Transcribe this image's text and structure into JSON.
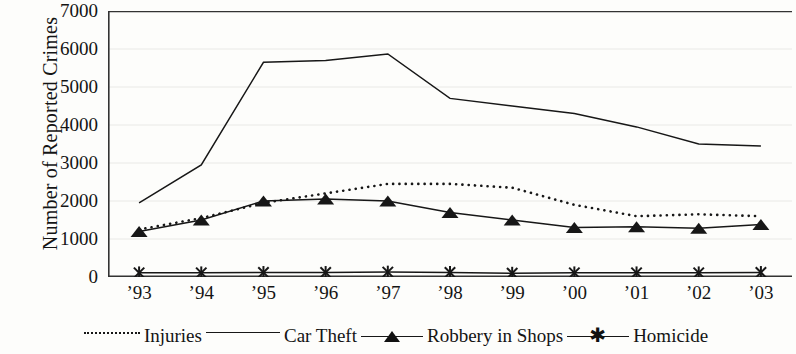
{
  "axes": {
    "ylabel": "Number of Reported Crimes",
    "yticks": [
      "0",
      "1000",
      "2000",
      "3000",
      "4000",
      "5000",
      "6000",
      "7000"
    ],
    "xticks": [
      "’93",
      "’94",
      "’95",
      "’96",
      "’97",
      "’98",
      "’99",
      "’00",
      "’01",
      "’02",
      "’03"
    ]
  },
  "legend": {
    "items": [
      {
        "label": "Injuries",
        "style": "dotted"
      },
      {
        "label": "Car Theft",
        "style": "solid"
      },
      {
        "label": "Robbery in Shops",
        "style": "solid-triangle"
      },
      {
        "label": "Homicide",
        "style": "solid-star"
      }
    ]
  },
  "colors": {
    "ink": "#171717",
    "grid": "#e9e9e6",
    "background": "#fdfdfb"
  },
  "chart_data": {
    "type": "line",
    "title": "",
    "xlabel": "",
    "ylabel": "Number of Reported Crimes",
    "categories": [
      "’93",
      "’94",
      "’95",
      "’96",
      "’97",
      "’98",
      "’99",
      "’00",
      "’01",
      "’02",
      "’03"
    ],
    "ylim": [
      0,
      7000
    ],
    "ytick_step": 1000,
    "grid": true,
    "legend_position": "bottom",
    "series": [
      {
        "name": "Injuries",
        "style": "dotted",
        "marker": "none",
        "values": [
          1250,
          1550,
          1950,
          2200,
          2450,
          2450,
          2350,
          1900,
          1600,
          1650,
          1600
        ]
      },
      {
        "name": "Car Theft",
        "style": "solid",
        "marker": "none",
        "values": [
          1950,
          2950,
          5650,
          5700,
          5870,
          4700,
          4500,
          4300,
          3950,
          3500,
          3450
        ]
      },
      {
        "name": "Robbery in Shops",
        "style": "solid",
        "marker": "triangle",
        "values": [
          1200,
          1500,
          2000,
          2050,
          2000,
          1700,
          1500,
          1300,
          1320,
          1280,
          1380
        ]
      },
      {
        "name": "Homicide",
        "style": "solid",
        "marker": "star",
        "values": [
          110,
          110,
          120,
          120,
          130,
          120,
          100,
          110,
          110,
          110,
          120
        ]
      }
    ]
  }
}
